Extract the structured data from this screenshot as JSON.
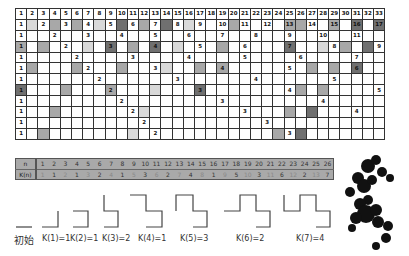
{
  "grid": {
    "columns": 33,
    "header": [
      "1",
      "2",
      "3",
      "4",
      "5",
      "6",
      "7",
      "8",
      "9",
      "10",
      "11",
      "12",
      "13",
      "14",
      "15",
      "16",
      "17",
      "18",
      "19",
      "20",
      "21",
      "22",
      "23",
      "24",
      "25",
      "26",
      "27",
      "28",
      "29",
      "30",
      "31",
      "32",
      "33"
    ],
    "rows": [
      {
        "step": 2,
        "shaded": {
          "2": 1,
          "4": 2,
          "6": 2,
          "8": 1,
          "10": 3,
          "12": 2,
          "14": 3,
          "16": 1,
          "20": 2,
          "25": 2,
          "26": 2,
          "29": 2,
          "31": 3,
          "33": 3
        }
      },
      {
        "step": 3,
        "shaded": {}
      },
      {
        "step": 4,
        "shaded": {
          "1": 2,
          "3": 2,
          "7": 1,
          "9": 3,
          "11": 2,
          "13": 3,
          "15": 1,
          "19": 2,
          "25": 3,
          "28": 1,
          "30": 2,
          "32": 3
        }
      },
      {
        "step": 5,
        "shaded": {}
      },
      {
        "step": 6,
        "shaded": {
          "2": 2,
          "6": 2,
          "10": 2,
          "14": 1,
          "17": 2,
          "19": 2,
          "27": 2,
          "29": 2,
          "31": 3
        }
      },
      {
        "step": 7,
        "shaded": {}
      },
      {
        "step": 8,
        "shaded": {
          "1": 3,
          "5": 2,
          "9": 2,
          "13": 1,
          "17": 3,
          "26": 2,
          "28": 2
        }
      },
      {
        "step": 9,
        "shaded": {}
      },
      {
        "step": 10,
        "shaded": {
          "4": 2,
          "12": 1,
          "25": 2,
          "27": 3
        }
      },
      {
        "step": 11,
        "shaded": {}
      },
      {
        "step": 12,
        "shaded": {
          "3": 2,
          "11": 1,
          "24": 2,
          "26": 3
        }
      }
    ]
  },
  "k_table": {
    "n_label": "n",
    "k_label": "K(n)",
    "n": [
      "1",
      "2",
      "3",
      "4",
      "5",
      "6",
      "7",
      "8",
      "9",
      "10",
      "11",
      "12",
      "13",
      "14",
      "15",
      "16",
      "17",
      "18",
      "19",
      "20",
      "21",
      "22",
      "23",
      "24",
      "25",
      "26"
    ],
    "k": [
      "1",
      "1",
      "2",
      "1",
      "3",
      "2",
      "4",
      "1",
      "5",
      "3",
      "6",
      "2",
      "7",
      "4",
      "8",
      "1",
      "9",
      "5",
      "10",
      "3",
      "11",
      "6",
      "12",
      "2",
      "13",
      "7"
    ]
  },
  "curves": {
    "initial_label": "初始",
    "captions": [
      "K(1)=1",
      "K(2)=1",
      "K(3)=2",
      "K(4)=1",
      "K(5)=3",
      "K(6)=2",
      "K(7)=4"
    ]
  },
  "colors": {
    "shade_light": "#d9d9d9",
    "shade_mid": "#a8a8a8",
    "shade_dark": "#707070",
    "ktable_bg": "#a9a9a9"
  }
}
